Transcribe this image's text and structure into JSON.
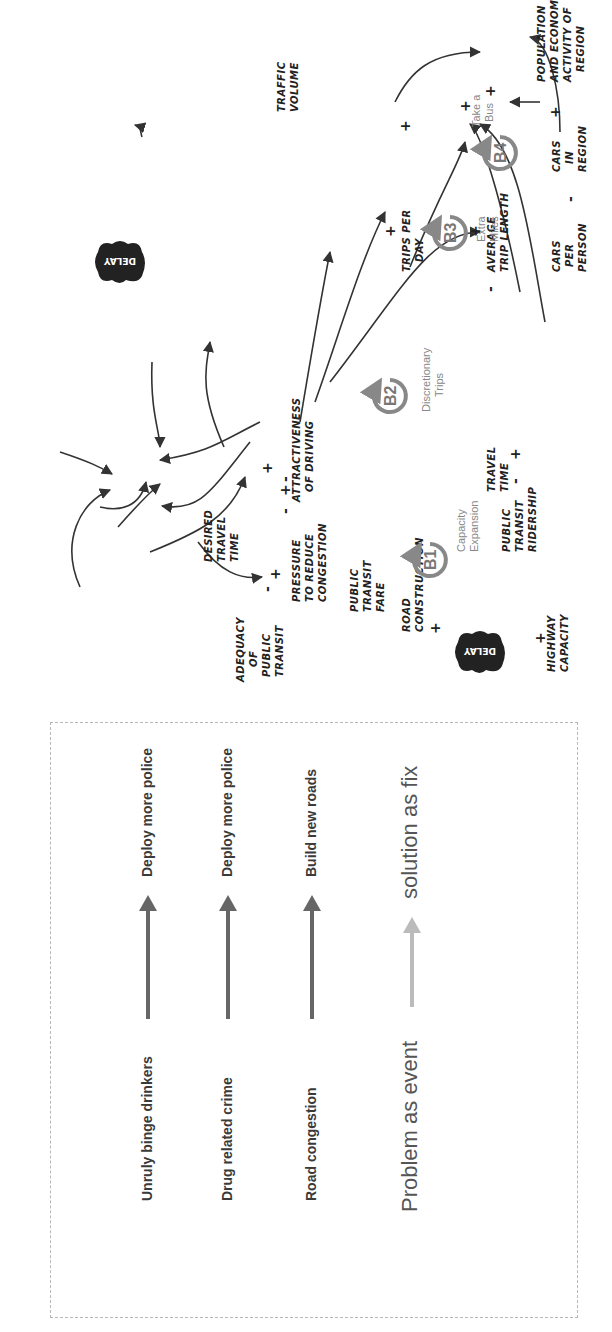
{
  "legend": {
    "rows": [
      {
        "problem": "Unruly binge drinkers",
        "fix": "Deploy more police",
        "arrow_color": "#666666"
      },
      {
        "problem": "Drug related crime",
        "fix": "Deploy more police",
        "arrow_color": "#666666"
      },
      {
        "problem": "Road congestion",
        "fix": "Build new roads",
        "arrow_color": "#666666"
      }
    ],
    "summary": {
      "problem": "Problem as event",
      "fix": "solution as fix",
      "arrow_color": "#bbbbbb"
    }
  },
  "diagram": {
    "nodes": {
      "highway_capacity": [
        "HIGHWAY",
        "CAPACITY"
      ],
      "road_construction": [
        "ROAD",
        "CONSTRUCTION"
      ],
      "pressure": [
        "PRESSURE",
        "TO REDUCE",
        "CONGESTION"
      ],
      "desired_travel_time": [
        "DESIRED",
        "TRAVEL",
        "TIME"
      ],
      "adequacy": [
        "ADEQUACY",
        "OF",
        "PUBLIC",
        "TRANSIT"
      ],
      "transit_fare": [
        "PUBLIC",
        "TRANSIT",
        "FARE"
      ],
      "travel_time": [
        "TRAVEL",
        "TIME"
      ],
      "attractiveness": [
        "ATTRACTIVENESS",
        "OF DRIVING"
      ],
      "transit_ridership": [
        "PUBLIC",
        "TRANSIT",
        "RIDERSHIP"
      ],
      "traffic_volume": [
        "TRAFFIC",
        "VOLUME"
      ],
      "trips_per_day": [
        "TRIPS PER",
        "DAY"
      ],
      "avg_trip_length": [
        "AVERAGE",
        "TRIP LENGTH"
      ],
      "cars_per_person": [
        "CARS",
        "PER",
        "PERSON"
      ],
      "cars_in_region": [
        "CARS",
        "IN",
        "REGION"
      ],
      "population": [
        "POPULATION",
        "AND ECONOMIC",
        "ACTIVITY OF",
        "REGION"
      ]
    },
    "delay_label": "DELAY",
    "loops": [
      {
        "id": "B1",
        "name": [
          "Capacity",
          "Expansion"
        ]
      },
      {
        "id": "B2",
        "name": [
          "Discretionary",
          "Trips"
        ]
      },
      {
        "id": "B3",
        "name": [
          "Extra",
          "Miles"
        ]
      },
      {
        "id": "B4",
        "name": [
          "Take a",
          "Bus"
        ]
      }
    ],
    "signs": {
      "plus": "+",
      "minus": "-"
    }
  }
}
